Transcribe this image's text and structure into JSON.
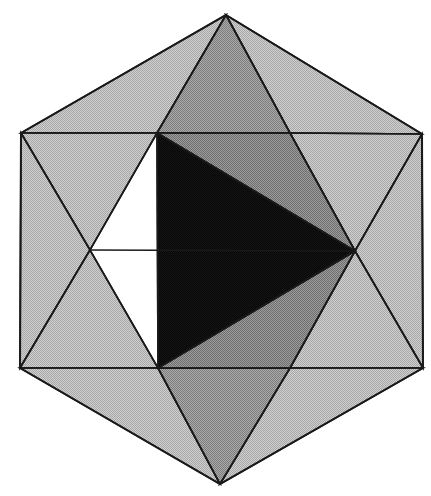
{
  "figure": {
    "kind": "polyhedron-projection",
    "background_color": "#ffffff",
    "canvas": {
      "width": 431,
      "height": 496
    },
    "edge_color": "#1a1a1a",
    "edge_width": 1.6,
    "palette": {
      "light_gray": "#bfbfbf",
      "medium_gray": "#9a9a9a",
      "dark_gray": "#8a8a8a",
      "black": "#0d0d0d"
    },
    "vertices": {
      "outer_hexagon": [
        {
          "name": "top",
          "x": 226,
          "y": 15
        },
        {
          "name": "upper-right",
          "x": 422,
          "y": 134
        },
        {
          "name": "lower-right",
          "x": 423,
          "y": 368
        },
        {
          "name": "bottom",
          "x": 220,
          "y": 484
        },
        {
          "name": "lower-left",
          "x": 20,
          "y": 368
        },
        {
          "name": "upper-left",
          "x": 21,
          "y": 133
        }
      ],
      "inner_hexagon": [
        {
          "name": "inner-top-left",
          "x": 157,
          "y": 133
        },
        {
          "name": "inner-top-right",
          "x": 290,
          "y": 133
        },
        {
          "name": "inner-right",
          "x": 355,
          "y": 251
        },
        {
          "name": "inner-bottom-right",
          "x": 290,
          "y": 368
        },
        {
          "name": "inner-bottom-left",
          "x": 158,
          "y": 368
        },
        {
          "name": "inner-left",
          "x": 90,
          "y": 250
        }
      ]
    },
    "faces": [
      {
        "name": "outer-upper-left",
        "shade": "light_gray",
        "points": "21,133 226,15 157,133"
      },
      {
        "name": "outer-upper-right",
        "shade": "light_gray",
        "points": "226,15 422,134 290,133"
      },
      {
        "name": "outer-left-upper",
        "shade": "light_gray",
        "points": "21,133 157,133 90,250"
      },
      {
        "name": "outer-right-upper",
        "shade": "light_gray",
        "points": "290,133 422,134 355,251"
      },
      {
        "name": "outer-left-lower",
        "shade": "light_gray",
        "points": "21,133 90,250 20,368"
      },
      {
        "name": "outer-right-lower",
        "shade": "light_gray",
        "points": "422,134 423,368 355,251"
      },
      {
        "name": "outer-lower-left-a",
        "shade": "light_gray",
        "points": "20,368 90,250 158,368"
      },
      {
        "name": "outer-lower-right-a",
        "shade": "light_gray",
        "points": "355,251 423,368 290,368"
      },
      {
        "name": "outer-bottom-left",
        "shade": "light_gray",
        "points": "20,368 158,368 220,484"
      },
      {
        "name": "outer-bottom-right",
        "shade": "light_gray",
        "points": "290,368 423,368 220,484"
      },
      {
        "name": "mid-top",
        "shade": "medium_gray",
        "points": "226,15 290,133 157,133"
      },
      {
        "name": "mid-bottom",
        "shade": "medium_gray",
        "points": "158,368 290,368 220,484"
      },
      {
        "name": "mid-upper-left",
        "shade": "dark_gray",
        "points": "157,133 290,133 355,251"
      },
      {
        "name": "mid-lower-left",
        "shade": "dark_gray",
        "points": "158,368 290,368 355,251"
      },
      {
        "name": "inner-upper-right",
        "shade": "dark_gray",
        "points": "157,133 355,251 290,133"
      },
      {
        "name": "inner-lower-right",
        "shade": "dark_gray",
        "points": "158,368 355,251 290,368"
      },
      {
        "name": "highlighted-triangle",
        "shade": "black",
        "points": "157,133 355,251 158,368"
      }
    ],
    "internal_edges": [
      {
        "name": "edge-inner-left-to-top-left",
        "x1": 90,
        "y1": 250,
        "x2": 157,
        "y2": 133
      },
      {
        "name": "edge-inner-left-to-bottom-left",
        "x1": 90,
        "y1": 250,
        "x2": 158,
        "y2": 368
      },
      {
        "name": "edge-inner-left-to-right",
        "x1": 90,
        "y1": 250,
        "x2": 355,
        "y2": 251
      },
      {
        "name": "edge-inner-left-to-outer-upper-left",
        "x1": 90,
        "y1": 250,
        "x2": 21,
        "y2": 133
      },
      {
        "name": "edge-inner-left-to-outer-lower-left",
        "x1": 90,
        "y1": 250,
        "x2": 20,
        "y2": 368
      },
      {
        "name": "edge-inner-right-to-outer-upper-right",
        "x1": 355,
        "y1": 251,
        "x2": 422,
        "y2": 134
      },
      {
        "name": "edge-inner-right-to-outer-lower-right",
        "x1": 355,
        "y1": 251,
        "x2": 423,
        "y2": 368
      },
      {
        "name": "edge-inner-right-to-top-right",
        "x1": 355,
        "y1": 251,
        "x2": 290,
        "y2": 133
      },
      {
        "name": "edge-inner-right-to-bottom-right",
        "x1": 355,
        "y1": 251,
        "x2": 290,
        "y2": 368
      },
      {
        "name": "edge-top-left-to-top-right",
        "x1": 157,
        "y1": 133,
        "x2": 290,
        "y2": 133
      },
      {
        "name": "edge-bottom-left-to-bottom-right",
        "x1": 158,
        "y1": 368,
        "x2": 290,
        "y2": 368
      },
      {
        "name": "edge-top-left-to-outer-upper-left",
        "x1": 157,
        "y1": 133,
        "x2": 21,
        "y2": 133
      },
      {
        "name": "edge-top-right-to-outer-upper-right",
        "x1": 290,
        "y1": 133,
        "x2": 422,
        "y2": 134
      },
      {
        "name": "edge-bottom-left-to-outer-lower-left",
        "x1": 158,
        "y1": 368,
        "x2": 20,
        "y2": 368
      },
      {
        "name": "edge-bottom-right-to-outer-lower-right",
        "x1": 290,
        "y1": 368,
        "x2": 423,
        "y2": 368
      },
      {
        "name": "edge-apex-top-to-top-left",
        "x1": 226,
        "y1": 15,
        "x2": 157,
        "y2": 133
      },
      {
        "name": "edge-apex-top-to-top-right",
        "x1": 226,
        "y1": 15,
        "x2": 290,
        "y2": 133
      },
      {
        "name": "edge-apex-bottom-to-bottom-left",
        "x1": 220,
        "y1": 484,
        "x2": 158,
        "y2": 368
      },
      {
        "name": "edge-apex-bottom-to-bottom-right",
        "x1": 220,
        "y1": 484,
        "x2": 290,
        "y2": 368
      },
      {
        "name": "edge-black-top-to-inner-right",
        "x1": 157,
        "y1": 133,
        "x2": 355,
        "y2": 251
      },
      {
        "name": "edge-black-bottom-to-inner-right",
        "x1": 158,
        "y1": 368,
        "x2": 355,
        "y2": 251
      },
      {
        "name": "edge-black-left-vertical",
        "x1": 157,
        "y1": 133,
        "x2": 158,
        "y2": 368
      }
    ],
    "outline_points": "226,15 422,134 423,368 220,484 20,368 21,133"
  }
}
